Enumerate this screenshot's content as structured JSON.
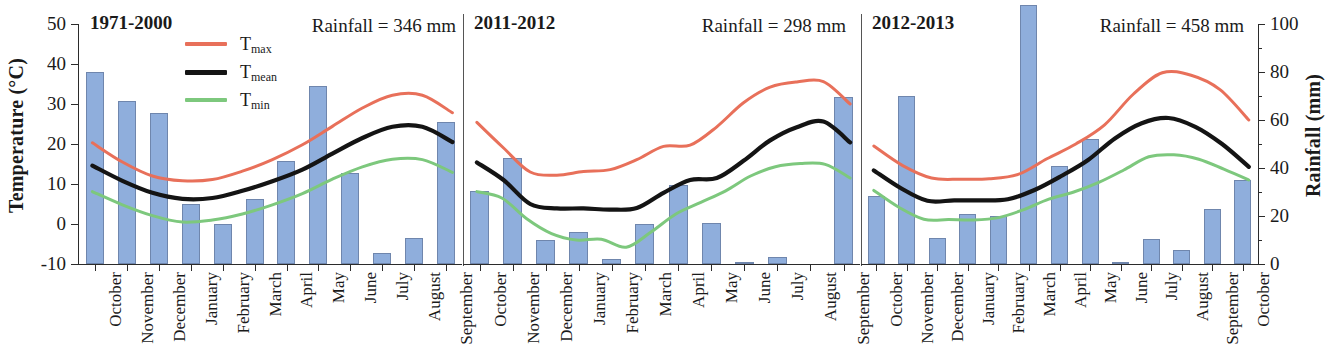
{
  "chart_data": {
    "type": "bar",
    "title": "",
    "ylabel": "Temperature (°C)",
    "ylabel_right": "Rainfall (mm)",
    "xlabel": "",
    "ylim": [
      -10,
      50
    ],
    "yticks": [
      -10,
      0,
      10,
      20,
      30,
      40,
      50
    ],
    "ylim_right": [
      0,
      100
    ],
    "yticks_right": [
      0,
      20,
      40,
      60,
      80,
      100
    ],
    "grid": false,
    "legend_position": "top-left of first panel",
    "legend": [
      {
        "name": "Tmax",
        "label_main": "T",
        "label_sub": "max",
        "color": "#E8705A"
      },
      {
        "name": "Tmean",
        "label_main": "T",
        "label_sub": "mean",
        "color": "#141414"
      },
      {
        "name": "Tmin",
        "label_main": "T",
        "label_sub": "min",
        "color": "#7DC87D"
      }
    ],
    "bar_color": "#8FAEDC",
    "bar_edge_color": "#6F86AD",
    "panels": [
      {
        "title": "1971-2000",
        "note": "Rainfall = 346 mm",
        "categories": [
          "October",
          "November",
          "December",
          "January",
          "February",
          "March",
          "April",
          "May",
          "June",
          "July",
          "August",
          "September"
        ],
        "rainfall": [
          80.0,
          68.0,
          63.0,
          25.0,
          16.5,
          27.0,
          43.0,
          74.0,
          38.0,
          4.5,
          11.0,
          59.0
        ],
        "series": [
          {
            "name": "Tmax",
            "values": [
              20.3,
              15.5,
              12.0,
              10.8,
              11.1,
              13.2,
              16.1,
              19.8,
              24.4,
              29.0,
              32.2,
              32.2,
              27.8
            ]
          },
          {
            "name": "Tmean",
            "values": [
              14.6,
              10.8,
              7.8,
              6.3,
              6.5,
              8.3,
              10.7,
              13.6,
              17.6,
              21.5,
              24.3,
              24.3,
              20.5
            ]
          },
          {
            "name": "Tmin",
            "values": [
              8.1,
              4.8,
              2.1,
              0.5,
              1.0,
              2.5,
              4.8,
              7.6,
              11.2,
              14.3,
              16.2,
              16.1,
              12.9
            ]
          }
        ]
      },
      {
        "title": "2011-2012",
        "note": "Rainfall = 298 mm",
        "categories": [
          "October",
          "November",
          "December",
          "January",
          "February",
          "March",
          "April",
          "May",
          "June",
          "July",
          "August",
          "September"
        ],
        "rainfall": [
          30.5,
          44.0,
          10.0,
          13.5,
          2.0,
          16.5,
          33.0,
          17.0,
          1.0,
          3.0,
          0.0,
          69.5
        ],
        "series": [
          {
            "name": "Tmax",
            "values": [
              25.4,
              19.0,
              13.0,
              12.2,
              13.1,
              13.6,
              16.1,
              19.4,
              19.7,
              24.3,
              30.3,
              34.2,
              35.5,
              35.6,
              30.0
            ]
          },
          {
            "name": "Tmean",
            "values": [
              15.4,
              11.0,
              5.0,
              3.9,
              3.9,
              3.6,
              4.0,
              7.8,
              11.0,
              11.5,
              15.8,
              20.9,
              24.2,
              25.6,
              20.4
            ]
          },
          {
            "name": "Tmin",
            "values": [
              8.1,
              6.5,
              1.3,
              -2.4,
              -4.0,
              -3.8,
              -5.8,
              -2.0,
              2.5,
              5.4,
              8.3,
              12.0,
              14.3,
              15.1,
              14.9,
              11.5
            ]
          }
        ]
      },
      {
        "title": "2012-2013",
        "note": "Rainfall = 458 mm",
        "categories": [
          "October",
          "November",
          "December",
          "January",
          "February",
          "March",
          "April",
          "May",
          "June",
          "July",
          "August",
          "September",
          "October"
        ],
        "rainfall": [
          28.5,
          70.0,
          11.0,
          21.0,
          20.0,
          108.0,
          41.0,
          52.0,
          1.0,
          10.5,
          6.0,
          23.0,
          35.0
        ],
        "series": [
          {
            "name": "Tmax",
            "values": [
              19.5,
              14.6,
              11.5,
              11.2,
              11.3,
              12.4,
              16.3,
              20.0,
              24.8,
              32.5,
              37.8,
              37.2,
              33.6,
              26.0
            ]
          },
          {
            "name": "Tmean",
            "values": [
              13.4,
              9.0,
              5.8,
              5.9,
              5.9,
              6.2,
              8.5,
              12.0,
              16.0,
              21.4,
              25.2,
              26.5,
              24.3,
              20.0,
              14.3
            ]
          },
          {
            "name": "Tmin",
            "values": [
              8.4,
              4.2,
              1.2,
              1.1,
              1.0,
              1.6,
              3.6,
              6.2,
              8.0,
              10.4,
              13.5,
              16.8,
              17.3,
              16.2,
              13.7,
              11.0
            ]
          }
        ]
      }
    ]
  }
}
